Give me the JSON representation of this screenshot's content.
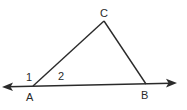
{
  "diagram": {
    "type": "geometry-triangle",
    "colors": {
      "stroke": "#2a2a2a",
      "background": "#ffffff"
    },
    "vertices": {
      "A": {
        "label": "A"
      },
      "B": {
        "label": "B"
      },
      "C": {
        "label": "C"
      }
    },
    "angles": [
      {
        "label": "1",
        "description": "exterior angle at A"
      },
      {
        "label": "2",
        "description": "interior angle at A"
      }
    ],
    "line": {
      "description": "line through A and B with arrows at both ends"
    }
  }
}
